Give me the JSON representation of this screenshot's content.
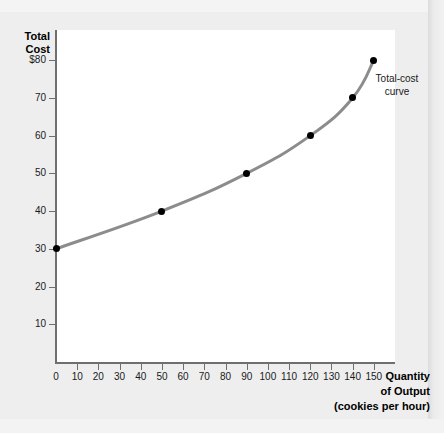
{
  "chart_data": {
    "type": "line",
    "title": "",
    "xlabel": "Quantity of Output (cookies per hour)",
    "ylabel": "Total Cost",
    "x": [
      0,
      50,
      90,
      120,
      140,
      150
    ],
    "values": [
      30,
      40,
      50,
      60,
      70,
      80
    ],
    "series": [
      {
        "name": "Total-cost curve",
        "x": [
          0,
          50,
          90,
          120,
          140,
          150
        ],
        "values": [
          30,
          40,
          50,
          60,
          70,
          80
        ]
      }
    ],
    "xlim": [
      0,
      160
    ],
    "ylim": [
      0,
      88
    ],
    "xticks": [
      0,
      10,
      20,
      30,
      40,
      50,
      60,
      70,
      80,
      90,
      100,
      110,
      120,
      130,
      140,
      150
    ],
    "xtick_labels": [
      "0",
      "10",
      "20",
      "30",
      "40",
      "50",
      "60",
      "70",
      "80",
      "90",
      "100",
      "110",
      "120",
      "130",
      "140",
      "150"
    ],
    "yticks": [
      10,
      20,
      30,
      40,
      50,
      60,
      70,
      80
    ],
    "ytick_labels": [
      "10",
      "20",
      "30",
      "40",
      "50",
      "60",
      "70",
      "$80"
    ],
    "grid": false,
    "legend": "none",
    "annotations": [
      {
        "text": "Total-cost curve",
        "x": 150,
        "y": 80
      }
    ],
    "curve_color": "#8c8c8c",
    "marker_color": "#000000",
    "axis_color": "#6f6f6f"
  },
  "axes": {
    "y_title_line1": "Total",
    "y_title_line2": "Cost",
    "x_title_line1": "Quantity",
    "x_title_line2": "of Output",
    "x_title_line3": "(cookies per hour)"
  },
  "annotation": {
    "line1": "Total-cost",
    "line2": "curve"
  }
}
